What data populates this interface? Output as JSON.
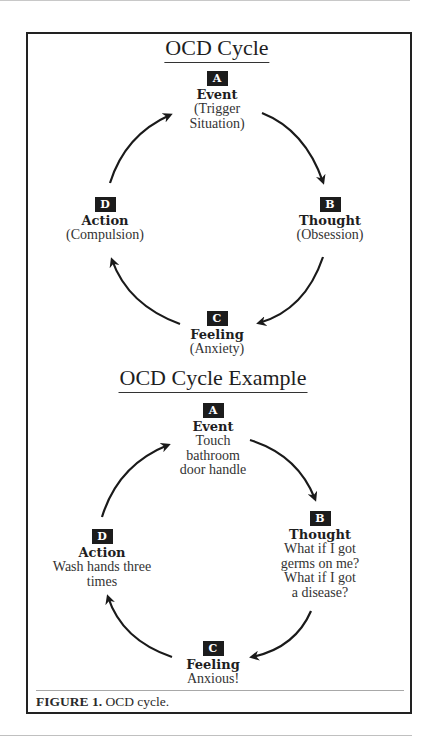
{
  "diagrams": [
    {
      "title": "OCD Cycle",
      "nodes": {
        "A": {
          "badge": "A",
          "label": "Event",
          "lines": [
            "(Trigger",
            "Situation)"
          ]
        },
        "B": {
          "badge": "B",
          "label": "Thought",
          "lines": [
            "(Obsession)"
          ]
        },
        "C": {
          "badge": "C",
          "label": "Feeling",
          "lines": [
            "(Anxiety)"
          ]
        },
        "D": {
          "badge": "D",
          "label": "Action",
          "lines": [
            "(Compulsion)"
          ]
        }
      }
    },
    {
      "title": "OCD Cycle Example",
      "nodes": {
        "A": {
          "badge": "A",
          "label": "Event",
          "lines": [
            "Touch",
            "bathroom",
            "door handle"
          ]
        },
        "B": {
          "badge": "B",
          "label": "Thought",
          "lines": [
            "What if I got",
            "germs on me?",
            "What if I got",
            "a disease?"
          ]
        },
        "C": {
          "badge": "C",
          "label": "Feeling",
          "lines": [
            "Anxious!"
          ]
        },
        "D": {
          "badge": "D",
          "label": "Action",
          "lines": [
            "Wash hands three",
            "times"
          ]
        }
      }
    }
  ],
  "flow": [
    "A",
    "B",
    "C",
    "D",
    "A"
  ],
  "caption": {
    "label": "FIGURE 1.",
    "text": " OCD cycle."
  },
  "colors": {
    "badge_bg": "#1c1c1c",
    "frame": "#222222",
    "text": "#2a2a2a"
  }
}
